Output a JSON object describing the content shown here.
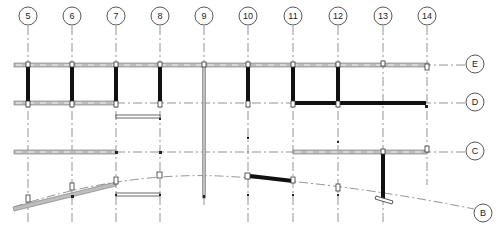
{
  "drawing": {
    "type": "structural framing plan",
    "column_grids": [
      {
        "label": "5",
        "x": 28
      },
      {
        "label": "6",
        "x": 72
      },
      {
        "label": "7",
        "x": 116
      },
      {
        "label": "8",
        "x": 160
      },
      {
        "label": "9",
        "x": 204
      },
      {
        "label": "10",
        "x": 248
      },
      {
        "label": "11",
        "x": 293
      },
      {
        "label": "12",
        "x": 338
      },
      {
        "label": "13",
        "x": 383
      },
      {
        "label": "14",
        "x": 427
      }
    ],
    "row_grids": [
      {
        "label": "E",
        "y": 65
      },
      {
        "label": "D",
        "y": 103
      },
      {
        "label": "C",
        "y": 152
      },
      {
        "label": "B",
        "curved": true
      }
    ],
    "colors": {
      "line": "#666666",
      "heavy_beam": "#111111",
      "light_beam": "#bdbdbd",
      "background": "#ffffff"
    }
  }
}
